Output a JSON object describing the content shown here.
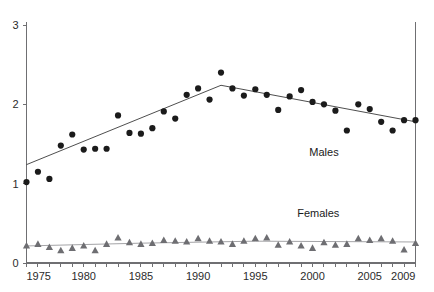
{
  "chart_data": {
    "type": "scatter",
    "title": "",
    "subtitle": "",
    "xlabel": "",
    "ylabel": "",
    "xlim": [
      1975,
      2009
    ],
    "ylim": [
      0,
      3
    ],
    "grid": false,
    "legend_position": "inline-annotation",
    "x_ticks_major": [
      "1975",
      "1980",
      "1985",
      "1990",
      "1995",
      "2000",
      "2005",
      "2009"
    ],
    "x_ticks_minor_interval": 1,
    "y_ticks": [
      "0",
      "1",
      "2",
      "3"
    ],
    "annotations": [
      {
        "text": "Males",
        "x": 2001.0,
        "y": 1.35
      },
      {
        "text": "Females",
        "x": 2000.5,
        "y": 0.58
      }
    ],
    "series": [
      {
        "name": "Males",
        "marker": "circle",
        "color": "#1b1b1b",
        "has_trend_line": true,
        "x": [
          1975,
          1976,
          1977,
          1978,
          1979,
          1980,
          1981,
          1982,
          1983,
          1984,
          1985,
          1986,
          1987,
          1988,
          1989,
          1990,
          1991,
          1992,
          1993,
          1994,
          1995,
          1996,
          1997,
          1998,
          1999,
          2000,
          2001,
          2002,
          2003,
          2004,
          2005,
          2006,
          2007,
          2008,
          2009
        ],
        "values": [
          1.02,
          1.15,
          1.06,
          1.48,
          1.62,
          1.43,
          1.44,
          1.44,
          1.86,
          1.64,
          1.63,
          1.7,
          1.91,
          1.82,
          2.12,
          2.2,
          2.06,
          2.4,
          2.2,
          2.11,
          2.19,
          2.12,
          1.93,
          2.1,
          2.18,
          2.03,
          2.0,
          1.92,
          1.67,
          2.0,
          1.94,
          1.78,
          1.67,
          1.8,
          1.8
        ]
      },
      {
        "name": "Females",
        "marker": "triangle",
        "color": "#6e6e72",
        "has_trend_line": true,
        "x": [
          1975,
          1976,
          1977,
          1978,
          1979,
          1980,
          1981,
          1982,
          1983,
          1984,
          1985,
          1986,
          1987,
          1988,
          1989,
          1990,
          1991,
          1992,
          1993,
          1994,
          1995,
          1996,
          1997,
          1998,
          1999,
          2000,
          2001,
          2002,
          2003,
          2004,
          2005,
          2006,
          2007,
          2008,
          2009
        ],
        "values": [
          0.22,
          0.24,
          0.2,
          0.16,
          0.19,
          0.22,
          0.16,
          0.24,
          0.32,
          0.26,
          0.24,
          0.25,
          0.29,
          0.28,
          0.27,
          0.31,
          0.28,
          0.27,
          0.24,
          0.28,
          0.31,
          0.32,
          0.23,
          0.27,
          0.22,
          0.19,
          0.26,
          0.23,
          0.24,
          0.31,
          0.29,
          0.31,
          0.28,
          0.17,
          0.25
        ]
      }
    ],
    "male_trend_points": [
      {
        "x": 1975,
        "y": 1.24
      },
      {
        "x": 1992,
        "y": 2.24
      },
      {
        "x": 2009,
        "y": 1.78
      }
    ],
    "female_trend_points": [
      {
        "x": 1975,
        "y": 0.215
      },
      {
        "x": 1985,
        "y": 0.25
      },
      {
        "x": 1995,
        "y": 0.275
      },
      {
        "x": 2009,
        "y": 0.265
      }
    ]
  },
  "axes": {
    "y_axis_name": "y-axis",
    "x_axis_name": "x-axis"
  }
}
